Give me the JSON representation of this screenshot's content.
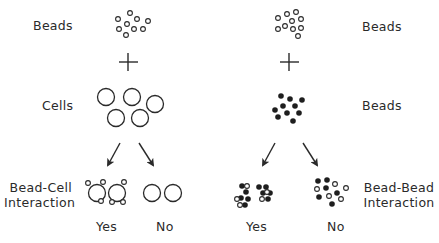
{
  "diagram": {
    "colors": {
      "ink": "#2a2a2a",
      "background": "#ffffff"
    },
    "left_panel": {
      "top_label": "Beads",
      "plus": "+",
      "middle_label": "Cells",
      "bottom_label_line1": "Bead-Cell",
      "bottom_label_line2": "Interaction",
      "outcome_yes": "Yes",
      "outcome_no": "No"
    },
    "right_panel": {
      "top_label": "Beads",
      "plus": "+",
      "middle_label": "Beads",
      "bottom_label_line1": "Bead-Bead",
      "bottom_label_line2": "Interaction",
      "outcome_yes": "Yes",
      "outcome_no": "No"
    }
  }
}
